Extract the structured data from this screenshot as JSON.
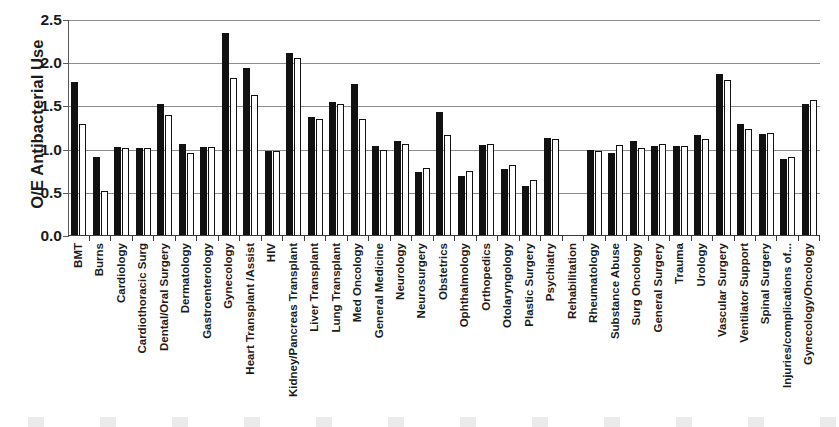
{
  "chart_data": {
    "type": "bar",
    "title": "",
    "xlabel": "",
    "ylabel": "O/E Antibacterial Use",
    "ylim": [
      0.0,
      2.5
    ],
    "ytick_labels": [
      "2.5",
      "2.0",
      "1.5",
      "1.0",
      "0.5",
      "0.0"
    ],
    "ytick_values": [
      2.5,
      2.0,
      1.5,
      1.0,
      0.5,
      0.0
    ],
    "grid": true,
    "legend": "none",
    "categories": [
      "BMT",
      "Burns",
      "Cardiology",
      "Cardiothoracic Surg",
      "Dental/Oral Surgery",
      "Dermatology",
      "Gastroenterology",
      "Gynecology",
      "Heart Transplant /Assist",
      "HIV",
      "Kidney/Pancreas Transplant",
      "Liver Transplant",
      "Lung Transplant",
      "Med Oncology",
      "General Medicine",
      "Neurology",
      "Neurosurgery",
      "Obstetrics",
      "Ophthalmology",
      "Orthopedics",
      "Otolaryngology",
      "Plastic Surgery",
      "Psychiatry",
      "Rehabilitation",
      "Rheumatology",
      "Substance Abuse",
      "Surg Oncology",
      "General Surgery",
      "Trauma",
      "Urology",
      "Vascular Surgery",
      "Ventilator Support",
      "Spinal Surgery",
      "Injuries/complications of...",
      "Gynecology/Oncology"
    ],
    "series": [
      {
        "name": "series-1",
        "style": "filled-black",
        "values": [
          1.78,
          0.91,
          1.03,
          1.02,
          1.53,
          1.07,
          1.03,
          2.35,
          1.95,
          0.98,
          2.12,
          1.38,
          1.55,
          1.76,
          1.04,
          1.1,
          0.74,
          1.44,
          0.7,
          1.05,
          0.78,
          0.58,
          1.13,
          null,
          0.99,
          0.96,
          1.1,
          1.04,
          1.04,
          1.17,
          1.87,
          1.3,
          1.18,
          0.89,
          1.53
        ]
      },
      {
        "name": "series-2",
        "style": "white-outlined",
        "values": [
          1.3,
          0.52,
          1.02,
          1.02,
          1.4,
          0.96,
          1.03,
          1.83,
          1.63,
          0.98,
          2.06,
          1.36,
          1.53,
          1.35,
          1.0,
          1.07,
          0.79,
          1.17,
          0.75,
          1.07,
          0.82,
          0.65,
          1.12,
          null,
          0.98,
          1.05,
          1.02,
          1.07,
          1.04,
          1.12,
          1.81,
          1.24,
          1.19,
          0.91,
          1.57
        ]
      }
    ]
  }
}
